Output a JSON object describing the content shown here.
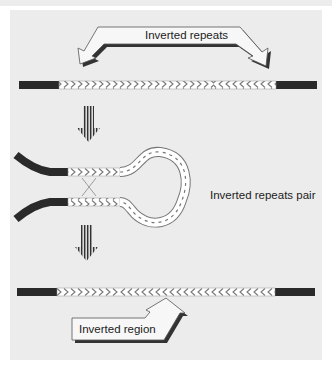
{
  "figure": {
    "labels": {
      "top_arrow": "Inverted repeats",
      "middle": "Inverted repeats pair",
      "bottom_arrow": "Inverted region"
    },
    "colors": {
      "background": "#ececec",
      "flank": "#2a2a2a",
      "hatch": "#ffffff",
      "hatch_stroke": "#777777",
      "arrow_fill": "#f7f7f7",
      "arrow_shadow": "#333333"
    },
    "stages": [
      {
        "name": "original",
        "segments": [
          "flank",
          "repeat-forward",
          "central-forward",
          "repeat-reverse",
          "flank"
        ]
      },
      {
        "name": "hairpin",
        "segments": [
          "flank",
          "repeat-forward",
          "loop",
          "repeat-reverse",
          "flank"
        ]
      },
      {
        "name": "inverted",
        "segments": [
          "flank",
          "repeat-forward",
          "central-reversed",
          "repeat-reverse",
          "flank"
        ]
      }
    ]
  }
}
